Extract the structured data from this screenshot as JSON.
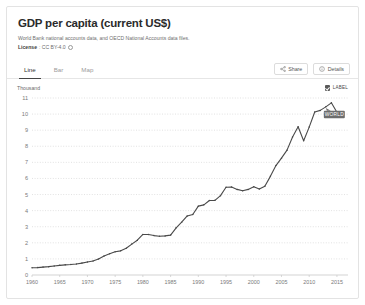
{
  "card": {
    "title": "GDP per capita (current US$)",
    "subtitle": "World Bank national accounts data, and OECD National Accounts data files.",
    "license_label": "License",
    "license_value": ": CC BY-4.0"
  },
  "tabs": [
    {
      "label": "Line",
      "active": true
    },
    {
      "label": "Bar",
      "active": false
    },
    {
      "label": "Map",
      "active": false
    }
  ],
  "actions": {
    "share_label": "Share",
    "details_label": "Details"
  },
  "legend": {
    "checkbox_label": "LABEL",
    "checked": true
  },
  "chart_data": {
    "type": "line",
    "title": "GDP per capita (current US$)",
    "unit_label": "Thousand",
    "xlabel": "",
    "ylabel": "Thousand",
    "xlim": [
      1960,
      2017
    ],
    "ylim": [
      0,
      11
    ],
    "grid": true,
    "legend_position": "inline-right",
    "series_label": "WORLD",
    "series_label_anchor_year": 2013,
    "xticks": [
      1960,
      1965,
      1970,
      1975,
      1980,
      1985,
      1990,
      1995,
      2000,
      2005,
      2010,
      2015
    ],
    "yticks": [
      0,
      1,
      2,
      3,
      4,
      5,
      6,
      7,
      8,
      9,
      10,
      11
    ],
    "series": [
      {
        "name": "WORLD",
        "color": "#4a4a4a",
        "x": [
          1960,
          1961,
          1962,
          1963,
          1964,
          1965,
          1966,
          1967,
          1968,
          1969,
          1970,
          1971,
          1972,
          1973,
          1974,
          1975,
          1976,
          1977,
          1978,
          1979,
          1980,
          1981,
          1982,
          1983,
          1984,
          1985,
          1986,
          1987,
          1988,
          1989,
          1990,
          1991,
          1992,
          1993,
          1994,
          1995,
          1996,
          1997,
          1998,
          1999,
          2000,
          2001,
          2002,
          2003,
          2004,
          2005,
          2006,
          2007,
          2008,
          2009,
          2010,
          2011,
          2012,
          2013,
          2014,
          2015,
          2016
        ],
        "values": [
          0.45,
          0.46,
          0.49,
          0.52,
          0.56,
          0.6,
          0.63,
          0.65,
          0.68,
          0.74,
          0.81,
          0.87,
          0.99,
          1.18,
          1.32,
          1.44,
          1.5,
          1.66,
          1.92,
          2.16,
          2.52,
          2.52,
          2.45,
          2.41,
          2.43,
          2.48,
          2.93,
          3.28,
          3.67,
          3.76,
          4.28,
          4.36,
          4.63,
          4.64,
          4.93,
          5.45,
          5.47,
          5.32,
          5.23,
          5.32,
          5.48,
          5.34,
          5.52,
          6.13,
          6.8,
          7.26,
          7.76,
          8.58,
          9.21,
          8.34,
          9.19,
          10.13,
          10.23,
          10.45,
          10.7,
          10.12,
          10.15
        ]
      }
    ]
  }
}
